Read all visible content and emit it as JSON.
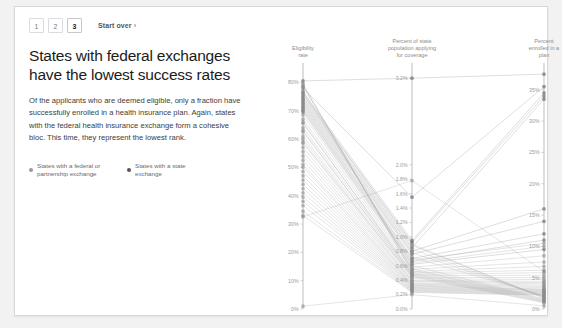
{
  "pager": {
    "pages": [
      "1",
      "2",
      "3"
    ],
    "active": "3",
    "start_over_label": "Start over",
    "chevron": "›"
  },
  "headline": "States with federal exchanges have the lowest success rates",
  "blurb": "Of the applicants who are deemed eligible, only a fraction have successfully enrolled in a health insurance plan. Again, states with the federal health insurance exchange form a cohesive bloc. This time, they represent the lowest rank.",
  "legend": [
    {
      "label": "States with a federal or partnership exchange",
      "color": "#9a9a9a"
    },
    {
      "label": "States with a state exchange",
      "color": "#555555"
    }
  ],
  "chart_data": {
    "type": "line",
    "subtype": "parallel-coordinates",
    "title": "States with federal exchanges have the lowest success rates",
    "grid": false,
    "legend_position": "left-panel",
    "axes": [
      {
        "name": "eligibility_rate",
        "label": "Eligibility rate",
        "ticks": [
          "0%",
          "10%",
          "20%",
          "30%",
          "40%",
          "50%",
          "60%",
          "70%",
          "80%"
        ],
        "tick_values": [
          0,
          10,
          20,
          30,
          40,
          50,
          60,
          70,
          80
        ],
        "range": [
          0,
          84
        ]
      },
      {
        "name": "percent_applying",
        "label": "Percent of state population applying for coverage",
        "ticks": [
          "0.0%",
          "0.2%",
          "0.4%",
          "0.6%",
          "0.8%",
          "1.0%",
          "1.2%",
          "1.4%",
          "1.6%",
          "1.8%",
          "2.0%",
          "3.2%"
        ],
        "tick_values": [
          0.0,
          0.2,
          0.4,
          0.6,
          0.8,
          1.0,
          1.2,
          1.4,
          1.6,
          1.8,
          2.0,
          3.2
        ],
        "range": [
          0,
          3.3
        ]
      },
      {
        "name": "percent_enrolled",
        "label": "Percent enrolled in a plan",
        "ticks": [
          "0%",
          "5%",
          "10%",
          "15%",
          "20%",
          "25%",
          "30%",
          "35%"
        ],
        "tick_values": [
          0,
          5,
          10,
          15,
          20,
          25,
          30,
          35
        ],
        "range": [
          0,
          38
        ]
      }
    ],
    "series": [
      {
        "name": "s01",
        "group": "state",
        "values": [
          80.5,
          3.2,
          37.5
        ]
      },
      {
        "name": "s02",
        "group": "state",
        "values": [
          78.0,
          1.55,
          35.5
        ]
      },
      {
        "name": "s03",
        "group": "state",
        "values": [
          76.5,
          0.95,
          34.5
        ]
      },
      {
        "name": "s04",
        "group": "state",
        "values": [
          75.5,
          0.92,
          34.0
        ]
      },
      {
        "name": "s05",
        "group": "state",
        "values": [
          74.5,
          0.85,
          33.5
        ]
      },
      {
        "name": "s06",
        "group": "state",
        "values": [
          73.5,
          0.8,
          16.0
        ]
      },
      {
        "name": "s07",
        "group": "state",
        "values": [
          72.5,
          0.76,
          14.0
        ]
      },
      {
        "name": "s08",
        "group": "state",
        "values": [
          71.5,
          0.7,
          12.0
        ]
      },
      {
        "name": "s09",
        "group": "state",
        "values": [
          70.5,
          0.66,
          11.0
        ]
      },
      {
        "name": "s10",
        "group": "state",
        "values": [
          69.5,
          0.62,
          9.5
        ]
      },
      {
        "name": "s11",
        "group": "federal",
        "values": [
          68.5,
          0.58,
          8.5
        ]
      },
      {
        "name": "s12",
        "group": "federal",
        "values": [
          67.0,
          0.55,
          7.5
        ]
      },
      {
        "name": "s13",
        "group": "federal",
        "values": [
          65.5,
          0.52,
          6.8
        ]
      },
      {
        "name": "s14",
        "group": "federal",
        "values": [
          64.0,
          0.5,
          6.2
        ]
      },
      {
        "name": "s15",
        "group": "federal",
        "values": [
          62.5,
          0.48,
          5.8
        ]
      },
      {
        "name": "s16",
        "group": "federal",
        "values": [
          61.0,
          0.46,
          5.4
        ]
      },
      {
        "name": "s17",
        "group": "federal",
        "values": [
          60.0,
          0.44,
          5.0
        ]
      },
      {
        "name": "s18",
        "group": "federal",
        "values": [
          58.5,
          0.42,
          4.7
        ]
      },
      {
        "name": "s19",
        "group": "federal",
        "values": [
          57.0,
          0.4,
          4.4
        ]
      },
      {
        "name": "s20",
        "group": "federal",
        "values": [
          55.5,
          0.39,
          4.2
        ]
      },
      {
        "name": "s21",
        "group": "federal",
        "values": [
          54.0,
          0.38,
          4.0
        ]
      },
      {
        "name": "s22",
        "group": "federal",
        "values": [
          52.5,
          0.36,
          3.8
        ]
      },
      {
        "name": "s23",
        "group": "federal",
        "values": [
          51.0,
          0.35,
          3.6
        ]
      },
      {
        "name": "s24",
        "group": "federal",
        "values": [
          50.0,
          0.34,
          3.4
        ]
      },
      {
        "name": "s25",
        "group": "federal",
        "values": [
          48.5,
          0.33,
          3.2
        ]
      },
      {
        "name": "s26",
        "group": "federal",
        "values": [
          47.0,
          0.32,
          3.1
        ]
      },
      {
        "name": "s27",
        "group": "federal",
        "values": [
          45.5,
          0.31,
          3.0
        ]
      },
      {
        "name": "s28",
        "group": "federal",
        "values": [
          44.0,
          0.3,
          2.9
        ]
      },
      {
        "name": "s29",
        "group": "federal",
        "values": [
          42.5,
          0.29,
          2.8
        ]
      },
      {
        "name": "s30",
        "group": "federal",
        "values": [
          41.0,
          0.28,
          2.7
        ]
      },
      {
        "name": "s31",
        "group": "federal",
        "values": [
          39.5,
          0.27,
          2.6
        ]
      },
      {
        "name": "s32",
        "group": "federal",
        "values": [
          38.0,
          0.26,
          2.5
        ]
      },
      {
        "name": "s33",
        "group": "federal",
        "values": [
          36.5,
          0.25,
          2.4
        ]
      },
      {
        "name": "s34",
        "group": "federal",
        "values": [
          34.5,
          0.24,
          2.3
        ]
      },
      {
        "name": "s35",
        "group": "federal",
        "values": [
          33.0,
          0.23,
          2.2
        ]
      },
      {
        "name": "s36",
        "group": "federal",
        "values": [
          70.0,
          0.64,
          10.0
        ]
      },
      {
        "name": "s37",
        "group": "federal",
        "values": [
          71.0,
          0.68,
          10.5
        ]
      },
      {
        "name": "s38",
        "group": "federal",
        "values": [
          72.0,
          0.72,
          2.1
        ]
      },
      {
        "name": "s39",
        "group": "federal",
        "values": [
          73.0,
          0.78,
          2.0
        ]
      },
      {
        "name": "s40",
        "group": "federal",
        "values": [
          74.0,
          0.83,
          1.9
        ]
      },
      {
        "name": "s41",
        "group": "federal",
        "values": [
          75.0,
          0.88,
          1.8
        ]
      },
      {
        "name": "s42",
        "group": "federal",
        "values": [
          76.0,
          0.9,
          1.7
        ]
      },
      {
        "name": "s43",
        "group": "federal",
        "values": [
          77.0,
          0.6,
          1.6
        ]
      },
      {
        "name": "s44",
        "group": "federal",
        "values": [
          78.5,
          0.56,
          1.5
        ]
      },
      {
        "name": "s45",
        "group": "federal",
        "values": [
          79.0,
          0.54,
          1.4
        ]
      },
      {
        "name": "s46",
        "group": "federal",
        "values": [
          79.5,
          0.51,
          1.3
        ]
      },
      {
        "name": "s47",
        "group": "federal",
        "values": [
          66.0,
          0.49,
          1.2
        ]
      },
      {
        "name": "s48",
        "group": "federal",
        "values": [
          63.0,
          0.47,
          1.1
        ]
      },
      {
        "name": "s49",
        "group": "federal",
        "values": [
          59.0,
          0.45,
          1.0
        ]
      },
      {
        "name": "s50",
        "group": "federal",
        "values": [
          1.0,
          0.2,
          0.5
        ]
      },
      {
        "name": "s51",
        "group": "federal",
        "values": [
          32.5,
          1.78,
          6.0
        ]
      }
    ]
  }
}
